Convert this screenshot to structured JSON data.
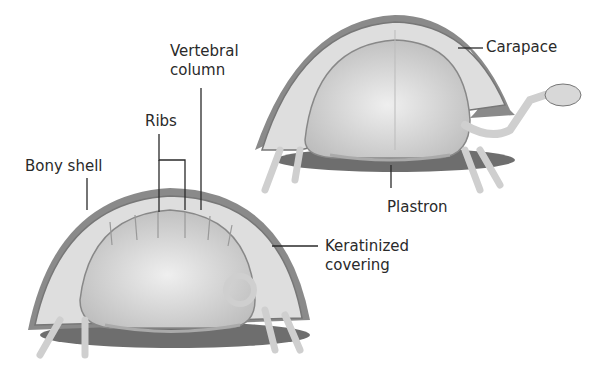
{
  "figure": {
    "labels": {
      "vertebral_column_line1": "Vertebral",
      "vertebral_column_line2": "column",
      "ribs": "Ribs",
      "bony_shell": "Bony shell",
      "carapace": "Carapace",
      "plastron": "Plastron",
      "keratinized_line1": "Keratinized",
      "keratinized_line2": "covering"
    },
    "colors": {
      "shell_dark": "#6e6e6e",
      "shell_mid": "#a8a8a8",
      "bone": "#e4e4e4",
      "interior": "#d2d2d2",
      "line": "#2a2a2a"
    }
  }
}
